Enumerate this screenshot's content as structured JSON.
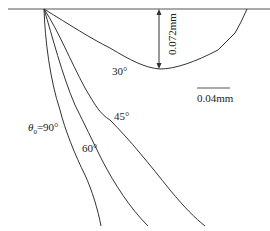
{
  "figure": {
    "depth_label": "0.072mm",
    "scale_bar_label": "0.04mm",
    "curves": [
      {
        "id": "30",
        "label": "30°"
      },
      {
        "id": "45",
        "label": "45°"
      },
      {
        "id": "60",
        "label": "60°"
      },
      {
        "id": "90",
        "label_prefix": "θ",
        "label_sub": "0",
        "label_suffix": "=90°"
      }
    ],
    "colors": {
      "line": "#333333",
      "surface": "#555555"
    }
  }
}
